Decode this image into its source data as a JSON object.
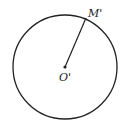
{
  "diagram": {
    "circle": {
      "cx": 65,
      "cy": 67,
      "r": 52,
      "stroke": "#222222"
    },
    "radius_line": {
      "x1": 65,
      "y1": 67,
      "x2": 86,
      "y2": 19
    },
    "center_label": "O'",
    "point_label": "M'"
  }
}
